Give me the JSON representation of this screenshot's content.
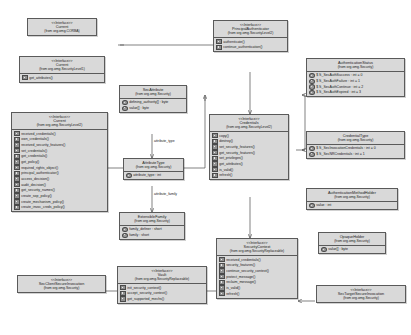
{
  "diagram": {
    "accent": "#d9d9d9",
    "border": "#5a5a5a",
    "background": "#ffffff"
  },
  "classes": {
    "current_corba": {
      "stereotype": "<<Interface>>",
      "name": "Current",
      "package": "(from org.omg.CORBA)",
      "members": []
    },
    "current_level1": {
      "stereotype": "<<Interface>>",
      "name": "Current",
      "package": "(from org.omg.SecurityLevel1)",
      "members": [
        {
          "kind": "op",
          "text": "get_attributes()"
        }
      ]
    },
    "current_level2": {
      "stereotype": "<<Interface>>",
      "name": "Current",
      "package": "(from org.omg.SecurityLevel2)",
      "members": [
        {
          "kind": "op",
          "text": "received_credentials()"
        },
        {
          "kind": "op",
          "text": "own_credentials()"
        },
        {
          "kind": "op",
          "text": "received_security_features()"
        },
        {
          "kind": "op",
          "text": "set_credentials()"
        },
        {
          "kind": "op",
          "text": "get_credentials()"
        },
        {
          "kind": "op",
          "text": "get_policy()"
        },
        {
          "kind": "op",
          "text": "required_rights_object()"
        },
        {
          "kind": "op",
          "text": "principal_authenticator()"
        },
        {
          "kind": "op",
          "text": "access_decision()"
        },
        {
          "kind": "op",
          "text": "audit_decision()"
        },
        {
          "kind": "op",
          "text": "get_security_names()"
        },
        {
          "kind": "op",
          "text": "create_sop_policy()"
        },
        {
          "kind": "op",
          "text": "create_mechanism_policy()"
        },
        {
          "kind": "op",
          "text": "create_invoc_creds_policy()"
        }
      ]
    },
    "sec_client_secure_invocation": {
      "stereotype": "<<Interface>>",
      "name": "SecClientSecureInvocation",
      "package": "(from org.omg.Security)",
      "members": []
    },
    "vault": {
      "stereotype": "<<Interface>>",
      "name": "Vault",
      "package": "(from org.omg.SecurityReplaceable)",
      "members": [
        {
          "kind": "op",
          "text": "init_security_context()"
        },
        {
          "kind": "op",
          "text": "accept_security_context()"
        },
        {
          "kind": "op",
          "text": "get_supported_mechs()"
        }
      ]
    },
    "sec_attribute": {
      "stereotype": "",
      "name": "SecAttribute",
      "package": "(from org.omg.Security)",
      "members": [
        {
          "kind": "attr",
          "text": "defining_authority[] : byte"
        },
        {
          "kind": "attr",
          "text": "value[] : byte"
        }
      ]
    },
    "attribute_type": {
      "stereotype": "",
      "name": "AttributeType",
      "package": "(from org.omg.Security)",
      "members": [
        {
          "kind": "attr",
          "text": "attribute_type : int"
        }
      ]
    },
    "extensible_family": {
      "stereotype": "",
      "name": "ExtensibleFamily",
      "package": "(from org.omg.Security)",
      "members": [
        {
          "kind": "attr",
          "text": "family_definer : short"
        },
        {
          "kind": "attr",
          "text": "family : short"
        }
      ]
    },
    "principal_authenticator": {
      "stereotype": "<<Interface>>",
      "name": "PrincipalAuthenticator",
      "package": "(from org.omg.SecurityLevel2)",
      "members": [
        {
          "kind": "op",
          "text": "authenticate()"
        },
        {
          "kind": "op",
          "text": "continue_authentication()"
        }
      ]
    },
    "credentials": {
      "stereotype": "<<Interface>>",
      "name": "Credentials",
      "package": "(from org.omg.SecurityLevel2)",
      "members": [
        {
          "kind": "op",
          "text": "copy()"
        },
        {
          "kind": "op",
          "text": "destroy()"
        },
        {
          "kind": "op",
          "text": "set_security_features()"
        },
        {
          "kind": "op",
          "text": "get_security_features()"
        },
        {
          "kind": "op",
          "text": "set_privileges()"
        },
        {
          "kind": "op",
          "text": "get_attributes()"
        },
        {
          "kind": "op",
          "text": "is_valid()"
        },
        {
          "kind": "op",
          "text": "refresh()"
        }
      ]
    },
    "security_context": {
      "stereotype": "<<Interface>>",
      "name": "SecurityContext",
      "package": "(from org.omg.SecurityReplaceable)",
      "members": [
        {
          "kind": "op",
          "text": "received_credentials()"
        },
        {
          "kind": "op",
          "text": "security_features()"
        },
        {
          "kind": "op",
          "text": "continue_security_context()"
        },
        {
          "kind": "op",
          "text": "protect_message()"
        },
        {
          "kind": "op",
          "text": "reclaim_message()"
        },
        {
          "kind": "op",
          "text": "is_valid()"
        },
        {
          "kind": "op",
          "text": "refresh()"
        }
      ]
    },
    "authentication_status": {
      "stereotype": "",
      "name": "AuthenticationStatus",
      "package": "(from org.omg.Security)",
      "members": [
        {
          "kind": "attr",
          "text": "$ S_SecAuthSuccess : int = 0"
        },
        {
          "kind": "attr",
          "text": "$ S_SecAuthFailure : int = 1"
        },
        {
          "kind": "attr",
          "text": "$ S_SecAuthContinue : int = 2"
        },
        {
          "kind": "attr",
          "text": "$ S_SecAuthExpired : int = 3"
        }
      ]
    },
    "credential_type": {
      "stereotype": "",
      "name": "CredentialType",
      "package": "(from org.omg.Security)",
      "members": [
        {
          "kind": "attr",
          "text": "$ S_SecInvocationCredentials : int = 0"
        },
        {
          "kind": "attr",
          "text": "$ S_SecNRCredentials : int = 1"
        }
      ]
    },
    "authentication_method_holder": {
      "stereotype": "",
      "name": "AuthenticationMethodHolder",
      "package": "(from org.omg.Security)",
      "members": [
        {
          "kind": "attr",
          "text": "value : int"
        }
      ]
    },
    "opaque_holder": {
      "stereotype": "",
      "name": "OpaqueHolder",
      "package": "(from org.omg.Security)",
      "members": [
        {
          "kind": "attr",
          "text": "value[] : byte"
        }
      ]
    },
    "sec_target_secure_invocation": {
      "stereotype": "<<Interface>>",
      "name": "SecTargetSecureInvocation",
      "package": "(from org.omg.Security)",
      "members": []
    }
  },
  "edge_labels": {
    "attribute_type": "attribute_type",
    "attribute_family": "attribute_family"
  }
}
